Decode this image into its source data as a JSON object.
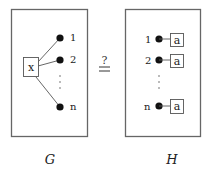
{
  "graph_g": {
    "caption": "G",
    "center_node": {
      "label": "x"
    },
    "leaves": [
      {
        "label": "1"
      },
      {
        "label": "2"
      },
      {
        "label": "n"
      }
    ],
    "ellipsis": "⋮"
  },
  "relation": {
    "symbol_top": "?",
    "symbol_bottom": "="
  },
  "graph_h": {
    "caption": "H",
    "rows": [
      {
        "index": "1",
        "node_label": "a"
      },
      {
        "index": "2",
        "node_label": "a"
      },
      {
        "index": "n",
        "node_label": "a"
      }
    ],
    "ellipsis": "⋮"
  },
  "colors": {
    "stroke": "#555555",
    "dot": "#111111",
    "text": "#222222"
  }
}
